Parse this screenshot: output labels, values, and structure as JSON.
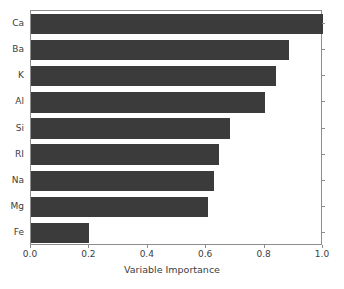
{
  "chart_data": {
    "type": "bar",
    "orientation": "horizontal",
    "title": "",
    "xlabel": "Variable Importance",
    "ylabel": "",
    "categories": [
      "Ca",
      "Ba",
      "K",
      "Al",
      "Si",
      "RI",
      "Na",
      "Mg",
      "Fe"
    ],
    "values": [
      1.0,
      0.885,
      0.84,
      0.8,
      0.68,
      0.645,
      0.625,
      0.605,
      0.2
    ],
    "xlim": [
      0.0,
      1.0
    ],
    "xticks": [
      0.0,
      0.2,
      0.4,
      0.6,
      0.8,
      1.0
    ],
    "xtick_labels": [
      "0.0",
      "0.2",
      "0.4",
      "0.6",
      "0.8",
      "1.0"
    ],
    "grid": false,
    "legend": null,
    "bar_color": "#3b3b3b",
    "axis_color": "#8d8d8d",
    "text_color": "#3d3d3d",
    "background": "#ffffff"
  }
}
